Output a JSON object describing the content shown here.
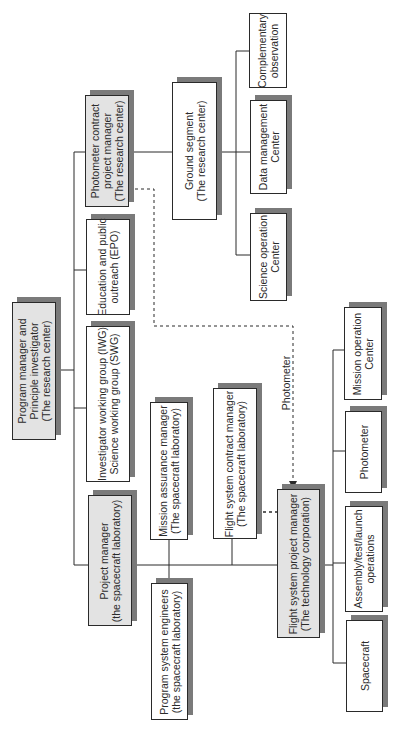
{
  "diagram": {
    "type": "organization-chart",
    "orientation": "rotated-90-ccw",
    "colors": {
      "highlight_fill": "#e3e3e3",
      "plain_fill": "#ffffff",
      "shadow": "#7a7a7a",
      "line": "#2a2a2a"
    },
    "nodes": {
      "program_manager": {
        "label": "Program manager and\nPrinciple investigator\n(The research center)",
        "style": "gray"
      },
      "photometer_contract_pm": {
        "label": "Photometer contract\nproject manager\n(The research center)",
        "style": "gray"
      },
      "epo": {
        "label": "Education and public\noutreach (EPO)",
        "style": "plain"
      },
      "iwg_swg": {
        "label": "Investigator working group (IWG)\nScience working group (SWG)",
        "style": "plain"
      },
      "project_manager": {
        "label": "Project manager\n(the spacecraft laboratory)",
        "style": "gray"
      },
      "ground_segment": {
        "label": "Ground segment\n(The research center)",
        "style": "plain"
      },
      "complementary_observation": {
        "label": "Complementary\nobservation",
        "style": "plain"
      },
      "data_management_center": {
        "label": "Data management\nCenter",
        "style": "plain"
      },
      "science_operation_center": {
        "label": "Science operation\nCenter",
        "style": "plain"
      },
      "mission_assurance_manager": {
        "label": "Mission assurance manager\n(The spacecraft laboratory)",
        "style": "plain"
      },
      "flight_system_contract_manager": {
        "label": "Flight system contract manager\n(The spacecraft laboratory)",
        "style": "plain"
      },
      "program_system_engineers": {
        "label": "Program system engineers\n(the spacecraft laboratory)",
        "style": "plain"
      },
      "flight_system_pm": {
        "label": "Flight system project manager\n(The technology corporation)",
        "style": "gray"
      },
      "mission_operation_center": {
        "label": "Mission operation\nCenter",
        "style": "plain"
      },
      "photometer": {
        "label": "Photometer",
        "style": "plain"
      },
      "assembly_test_launch": {
        "label": "Assembly/test/launch\noperations",
        "style": "plain"
      },
      "spacecraft": {
        "label": "Spacecraft",
        "style": "plain"
      }
    },
    "edges": [
      {
        "from": "program_manager",
        "to": "photometer_contract_pm",
        "type": "solid"
      },
      {
        "from": "program_manager",
        "to": "epo",
        "type": "solid"
      },
      {
        "from": "program_manager",
        "to": "iwg_swg",
        "type": "solid"
      },
      {
        "from": "program_manager",
        "to": "project_manager",
        "type": "solid"
      },
      {
        "from": "photometer_contract_pm",
        "to": "ground_segment",
        "type": "solid"
      },
      {
        "from": "ground_segment",
        "to": "complementary_observation",
        "type": "solid"
      },
      {
        "from": "ground_segment",
        "to": "data_management_center",
        "type": "solid"
      },
      {
        "from": "ground_segment",
        "to": "science_operation_center",
        "type": "solid"
      },
      {
        "from": "project_manager",
        "to": "mission_assurance_manager",
        "type": "solid"
      },
      {
        "from": "project_manager",
        "to": "program_system_engineers",
        "type": "solid"
      },
      {
        "from": "project_manager",
        "to": "flight_system_contract_manager",
        "type": "solid"
      },
      {
        "from": "project_manager",
        "to": "flight_system_pm",
        "type": "solid"
      },
      {
        "from": "flight_system_contract_manager",
        "to": "flight_system_pm",
        "type": "dashed"
      },
      {
        "from": "photometer_contract_pm",
        "to": "flight_system_pm",
        "type": "dashed-arrow",
        "label": "Photometer"
      },
      {
        "from": "flight_system_pm",
        "to": "mission_operation_center",
        "type": "solid"
      },
      {
        "from": "flight_system_pm",
        "to": "photometer",
        "type": "solid"
      },
      {
        "from": "flight_system_pm",
        "to": "assembly_test_launch",
        "type": "solid"
      },
      {
        "from": "flight_system_pm",
        "to": "spacecraft",
        "type": "solid"
      }
    ],
    "edge_labels": {
      "photometer_link": "Photometer"
    }
  }
}
